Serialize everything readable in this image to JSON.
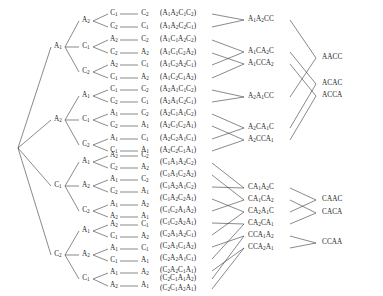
{
  "figure": {
    "type": "permutation-tree-diagram",
    "symbols": [
      "A1",
      "A2",
      "C1",
      "C2"
    ]
  },
  "tree": {
    "root": "",
    "level1": [
      "A1",
      "A2",
      "C1",
      "C2"
    ],
    "nodes": [
      {
        "level1": "A1",
        "level2": [
          "A2",
          "C1",
          "C2"
        ],
        "level3": [
          [
            "C1",
            "C2"
          ],
          [
            "A2",
            "C2"
          ],
          [
            "A2",
            "C1"
          ]
        ],
        "level4": [
          [
            "C2",
            "C1"
          ],
          [
            "C2",
            "A2"
          ],
          [
            "C1",
            "A2"
          ]
        ]
      },
      {
        "level1": "A2",
        "level2": [
          "A1",
          "C1",
          "C2"
        ],
        "level3": [
          [
            "C1",
            "C2"
          ],
          [
            "A1",
            "C2"
          ],
          [
            "A1",
            "C1"
          ]
        ],
        "level4": [
          [
            "C2",
            "C1"
          ],
          [
            "C2",
            "A1"
          ],
          [
            "C1",
            "A1"
          ]
        ]
      },
      {
        "level1": "C1",
        "level2": [
          "A1",
          "A2",
          "C2"
        ],
        "level3": [
          [
            "A2",
            "C2"
          ],
          [
            "A1",
            "C2"
          ],
          [
            "A1",
            "A2"
          ]
        ],
        "level4": [
          [
            "C2",
            "A2"
          ],
          [
            "C2",
            "A1"
          ],
          [
            "A2",
            "A1"
          ]
        ]
      },
      {
        "level1": "C2",
        "level2": [
          "A1",
          "A2",
          "C1"
        ],
        "level3": [
          [
            "A2",
            "C1"
          ],
          [
            "A1",
            "C1"
          ],
          [
            "A1",
            "A2"
          ]
        ],
        "level4": [
          [
            "C1",
            "A2"
          ],
          [
            "C1",
            "A1"
          ],
          [
            "A2",
            "A1"
          ]
        ]
      }
    ]
  },
  "level1_labels": [
    {
      "text": "A1",
      "x": 58,
      "y": 47
    },
    {
      "text": "A2",
      "x": 58,
      "y": 120
    },
    {
      "text": "C1",
      "x": 58,
      "y": 186
    },
    {
      "text": "C2",
      "x": 58,
      "y": 255
    }
  ],
  "level2_labels": [
    {
      "text": "A2",
      "x": 86,
      "y": 21
    },
    {
      "text": "C1",
      "x": 86,
      "y": 47
    },
    {
      "text": "C2",
      "x": 86,
      "y": 72
    },
    {
      "text": "A1",
      "x": 86,
      "y": 96
    },
    {
      "text": "C1",
      "x": 86,
      "y": 120
    },
    {
      "text": "C2",
      "x": 86,
      "y": 145
    },
    {
      "text": "A1",
      "x": 86,
      "y": 162
    },
    {
      "text": "A2",
      "x": 86,
      "y": 186
    },
    {
      "text": "C2",
      "x": 86,
      "y": 211
    },
    {
      "text": "A1",
      "x": 86,
      "y": 231
    },
    {
      "text": "A2",
      "x": 86,
      "y": 255
    },
    {
      "text": "C1",
      "x": 86,
      "y": 279
    }
  ],
  "level3_labels": [
    {
      "text": "C1",
      "x": 114,
      "y": 14
    },
    {
      "text": "C2",
      "x": 114,
      "y": 27
    },
    {
      "text": "A2",
      "x": 114,
      "y": 40
    },
    {
      "text": "C2",
      "x": 114,
      "y": 53
    },
    {
      "text": "A2",
      "x": 114,
      "y": 65
    },
    {
      "text": "C1",
      "x": 114,
      "y": 78
    },
    {
      "text": "C1",
      "x": 114,
      "y": 90
    },
    {
      "text": "C2",
      "x": 114,
      "y": 102
    },
    {
      "text": "A1",
      "x": 114,
      "y": 114
    },
    {
      "text": "C2",
      "x": 114,
      "y": 126
    },
    {
      "text": "A1",
      "x": 114,
      "y": 139
    },
    {
      "text": "C1",
      "x": 114,
      "y": 151
    },
    {
      "text": "A2",
      "x": 114,
      "y": 156
    },
    {
      "text": "C2",
      "x": 114,
      "y": 168
    },
    {
      "text": "A1",
      "x": 114,
      "y": 180
    },
    {
      "text": "C2",
      "x": 114,
      "y": 192
    },
    {
      "text": "A1",
      "x": 114,
      "y": 205
    },
    {
      "text": "A2",
      "x": 114,
      "y": 217
    },
    {
      "text": "A2",
      "x": 114,
      "y": 225
    },
    {
      "text": "C1",
      "x": 114,
      "y": 237
    },
    {
      "text": "A1",
      "x": 114,
      "y": 249
    },
    {
      "text": "C1",
      "x": 114,
      "y": 261
    },
    {
      "text": "A1",
      "x": 114,
      "y": 273
    },
    {
      "text": "A2",
      "x": 114,
      "y": 286
    }
  ],
  "level4_labels": [
    {
      "text": "C2",
      "x": 145,
      "y": 14
    },
    {
      "text": "C1",
      "x": 145,
      "y": 27
    },
    {
      "text": "C2",
      "x": 145,
      "y": 40
    },
    {
      "text": "A2",
      "x": 145,
      "y": 53
    },
    {
      "text": "C1",
      "x": 145,
      "y": 65
    },
    {
      "text": "A2",
      "x": 145,
      "y": 78
    },
    {
      "text": "C2",
      "x": 145,
      "y": 90
    },
    {
      "text": "C1",
      "x": 145,
      "y": 102
    },
    {
      "text": "C2",
      "x": 145,
      "y": 114
    },
    {
      "text": "A1",
      "x": 145,
      "y": 126
    },
    {
      "text": "C1",
      "x": 145,
      "y": 139
    },
    {
      "text": "A1",
      "x": 145,
      "y": 151
    },
    {
      "text": "C2",
      "x": 145,
      "y": 156
    },
    {
      "text": "A2",
      "x": 145,
      "y": 168
    },
    {
      "text": "C2",
      "x": 145,
      "y": 180
    },
    {
      "text": "A1",
      "x": 145,
      "y": 192
    },
    {
      "text": "A2",
      "x": 145,
      "y": 205
    },
    {
      "text": "A1",
      "x": 145,
      "y": 217
    },
    {
      "text": "C1",
      "x": 145,
      "y": 225
    },
    {
      "text": "A2",
      "x": 145,
      "y": 237
    },
    {
      "text": "C1",
      "x": 145,
      "y": 249
    },
    {
      "text": "A1",
      "x": 145,
      "y": 261
    },
    {
      "text": "A2",
      "x": 145,
      "y": 273
    },
    {
      "text": "A1",
      "x": 145,
      "y": 286
    }
  ],
  "permutations": [
    {
      "text": "(A1A2C1C2)",
      "y": 14
    },
    {
      "text": "(A1A2C2C1)",
      "y": 27
    },
    {
      "text": "(A1C1A2C2)",
      "y": 40
    },
    {
      "text": "(A1C1C2A2)",
      "y": 53
    },
    {
      "text": "(A1C2A2C1)",
      "y": 65
    },
    {
      "text": "(A1C2C1A2)",
      "y": 78
    },
    {
      "text": "(A2A1C1C2)",
      "y": 90
    },
    {
      "text": "(A2A1C2C1)",
      "y": 102
    },
    {
      "text": "(A2C1A1C2)",
      "y": 114
    },
    {
      "text": "(A2C1C2A1)",
      "y": 126
    },
    {
      "text": "(A2C2A1C1)",
      "y": 139
    },
    {
      "text": "(A2C2C1A1)",
      "y": 151
    },
    {
      "text": "(C1A1A2C2)",
      "y": 163
    },
    {
      "text": "(C1A1C2A2)",
      "y": 175
    },
    {
      "text": "(C1A2A1C2)",
      "y": 187
    },
    {
      "text": "(C1A2C2A1)",
      "y": 199
    },
    {
      "text": "(C1C2A1A2)",
      "y": 211
    },
    {
      "text": "(C1C2A2A1)",
      "y": 223
    },
    {
      "text": "(C2A1A2C1)",
      "y": 235
    },
    {
      "text": "(C2A1C1A2)",
      "y": 247
    },
    {
      "text": "(C2A2A1C1)",
      "y": 259
    },
    {
      "text": "(C2A2C1A1)",
      "y": 271
    },
    {
      "text": "(C2C1A1A2)",
      "y": 279
    },
    {
      "text": "(C2C1A2A1)",
      "y": 289
    }
  ],
  "classes": [
    {
      "text": "A1A2CC",
      "x": 248,
      "y": 20
    },
    {
      "text": "A1CA2C",
      "x": 248,
      "y": 52
    },
    {
      "text": "A1CCA2",
      "x": 248,
      "y": 64
    },
    {
      "text": "A2A1CC",
      "x": 248,
      "y": 97
    },
    {
      "text": "A2CA1C",
      "x": 248,
      "y": 128
    },
    {
      "text": "A2CCA1",
      "x": 248,
      "y": 140
    },
    {
      "text": "CA1A2C",
      "x": 248,
      "y": 188
    },
    {
      "text": "CA1CA2",
      "x": 248,
      "y": 200
    },
    {
      "text": "CA2A1C",
      "x": 248,
      "y": 212
    },
    {
      "text": "CA2CA1",
      "x": 248,
      "y": 224
    },
    {
      "text": "CCA1A2",
      "x": 248,
      "y": 236
    },
    {
      "text": "CCA2A1",
      "x": 248,
      "y": 248
    }
  ],
  "words": [
    {
      "text": "AACC",
      "x": 322,
      "y": 58
    },
    {
      "text": "ACAC",
      "x": 322,
      "y": 84
    },
    {
      "text": "ACCA",
      "x": 322,
      "y": 96
    },
    {
      "text": "CAAC",
      "x": 322,
      "y": 200
    },
    {
      "text": "CACA",
      "x": 322,
      "y": 213
    },
    {
      "text": "CCAA",
      "x": 322,
      "y": 243
    }
  ],
  "colors": {
    "line": "#3a3a3a",
    "text": "#1a1a1a",
    "background": "#ffffff"
  }
}
